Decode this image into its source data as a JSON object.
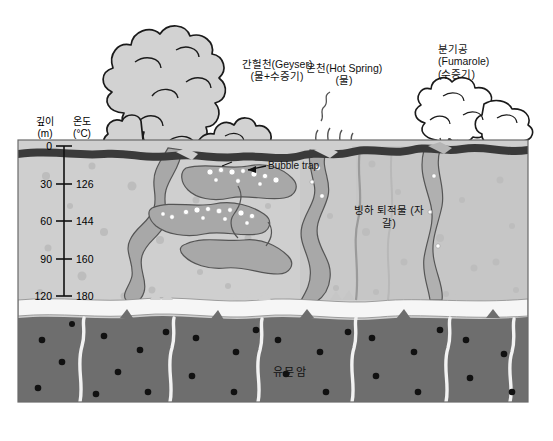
{
  "figure": {
    "title_visible": false,
    "axis": {
      "depth_header": "깊이",
      "depth_unit": "(m)",
      "temp_header": "온도",
      "temp_unit": "(°C)",
      "ticks": [
        {
          "depth": "0",
          "temp": ""
        },
        {
          "depth": "30",
          "temp": "126"
        },
        {
          "depth": "60",
          "temp": "144"
        },
        {
          "depth": "90",
          "temp": "160"
        },
        {
          "depth": "120",
          "temp": "180"
        }
      ]
    },
    "labels": {
      "geyser_l1": "간헐천(Geyser)",
      "geyser_l2": "(물+수증기)",
      "hotspring_l1": "온천(Hot Spring)",
      "hotspring_l2": "(물)",
      "fumarole_l1": "분기공",
      "fumarole_l2": "(Fumarole)",
      "fumarole_l3": "(수증기)",
      "bubble_trap": "Bubble trap",
      "glacial_l1": "빙하 퇴적물",
      "glacial_l2": "(자갈)",
      "rhyolite": "유문암"
    },
    "colors": {
      "surface_crust": "#3a3a3a",
      "sediment": "#cfcfcf",
      "sediment_dark": "#b4b4b4",
      "conduit": "#a8a8a8",
      "aquifer": "#f4f4f4",
      "bedrock": "#6e6e6e",
      "plume_fill": "#d2d2d2",
      "outline": "#1a1a1a",
      "page_background": "#ffffff"
    }
  }
}
